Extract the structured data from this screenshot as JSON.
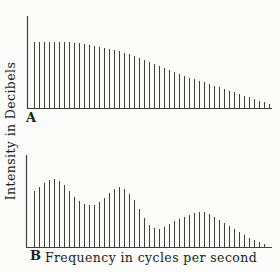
{
  "figure": {
    "ylabel": "Intensity in Decibels",
    "xlabel": "Frequency in cycles per second",
    "panels": {
      "a": "A",
      "b": "B"
    }
  },
  "colors": {
    "background": "#fbfbf9",
    "line": "#3f3f3f",
    "text": "#201e1b"
  },
  "chart_data": [
    {
      "type": "bar",
      "panel_label": "A",
      "title": "",
      "xlabel": "Frequency in cycles per second",
      "ylabel": "Intensity in Decibels",
      "description": "Harmonic line spectrum: flat envelope that rolls off smoothly to near zero at high frequency",
      "units": "relative intensity (pixel heights; axes are unlabeled)",
      "x_axis_ticks": [],
      "y_axis_ticks": [],
      "grid": false,
      "legend": false,
      "x_start": 34,
      "x_step": 5,
      "axis": {
        "x": 27,
        "y_top": 16,
        "y_base": 108,
        "x_end": 272
      },
      "values": [
        66,
        66,
        66,
        66,
        66,
        66,
        66,
        66,
        65,
        65,
        64,
        63,
        62,
        61,
        60,
        59,
        58,
        57,
        55,
        54,
        52,
        50,
        48,
        46,
        44,
        42,
        40,
        38,
        36,
        34,
        32,
        30,
        29,
        27,
        26,
        24,
        22,
        21,
        19,
        17,
        16,
        14,
        12,
        11,
        9,
        7,
        6,
        4
      ]
    },
    {
      "type": "bar",
      "panel_label": "B",
      "title": "",
      "xlabel": "Frequency in cycles per second",
      "ylabel": "Intensity in Decibels",
      "description": "Harmonic line spectrum with three formant-like peaks separated by dips, decaying to near zero",
      "units": "relative intensity (pixel heights; axes are unlabeled)",
      "x_axis_ticks": [],
      "y_axis_ticks": [],
      "grid": false,
      "legend": false,
      "x_start": 34,
      "x_step": 5,
      "axis": {
        "x": 26,
        "y_top": 155,
        "y_base": 247,
        "x_end": 272
      },
      "values": [
        56,
        60,
        64,
        67,
        68,
        66,
        62,
        56,
        50,
        46,
        43,
        42,
        42,
        45,
        49,
        54,
        58,
        60,
        58,
        53,
        47,
        38,
        29,
        22,
        19,
        18,
        20,
        23,
        26,
        28,
        30,
        32,
        34,
        35,
        35,
        33,
        30,
        27,
        24,
        21,
        18,
        15,
        12,
        9,
        7,
        5,
        3
      ]
    }
  ]
}
